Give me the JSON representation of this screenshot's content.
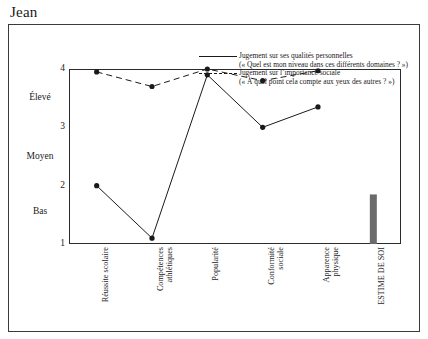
{
  "page_title": "Jean",
  "legend": {
    "series1": {
      "label": "Jugement sur ses qualités personnelles",
      "sublabel": "(« Quel est mon niveau dans ces différents domaines ? »)",
      "style": "solid"
    },
    "series2": {
      "label": "Jugement sur l’importance sociale",
      "sublabel": "(« À quel point cela compte aux yeux des autres ? »)",
      "style": "dashed"
    }
  },
  "chart_data": {
    "type": "line",
    "title": "Jean",
    "xlabel": "",
    "ylabel": "",
    "ylim": [
      1,
      4
    ],
    "yticks": [
      1,
      2,
      3,
      4
    ],
    "ytick_labels": [
      "1",
      "2",
      "3",
      "4"
    ],
    "y_category_labels": [
      {
        "text": "Bas",
        "value": 1.55
      },
      {
        "text": "Moyen",
        "value": 2.5
      },
      {
        "text": "Élevé",
        "value": 3.5
      }
    ],
    "grid": false,
    "legend_position": "top-right",
    "categories": [
      "Réussite scolaire",
      "Compétences\nathlétiques",
      "Popularité",
      "Conformité\nsociale",
      "Apparence\nphysique",
      "ESTIME DE SOI"
    ],
    "series": [
      {
        "name": "Jugement sur ses qualités personnelles",
        "style": "solid",
        "marker": "filled-circle",
        "color": "#1a1a1a",
        "values": [
          2.0,
          1.1,
          3.9,
          3.0,
          3.35,
          null
        ]
      },
      {
        "name": "Jugement sur l’importance sociale",
        "style": "dashed",
        "marker": "filled-circle",
        "color": "#1a1a1a",
        "values": [
          3.95,
          3.7,
          4.0,
          3.8,
          3.97,
          null
        ]
      }
    ],
    "bar": {
      "name": "ESTIME DE SOI",
      "category_index": 5,
      "value": 1.85,
      "base": 1.0,
      "color": "#6b6b6b"
    }
  }
}
